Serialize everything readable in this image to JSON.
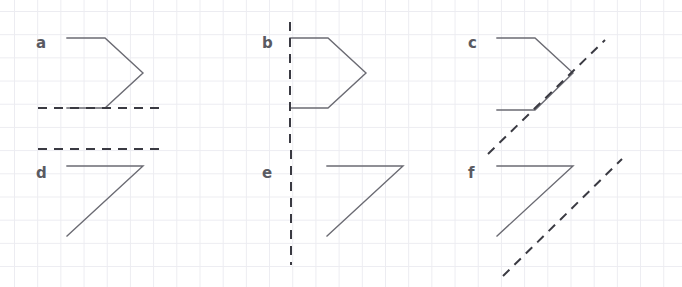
{
  "worksheet": {
    "title": "Reflections worksheet",
    "description": "Six lettered figures drawn on a light square grid, each paired with a dashed mirror line",
    "width": 682,
    "height": 287,
    "background_color": "#ffffff",
    "grid": {
      "visible": true,
      "color": "#ececf1",
      "spacing": 23.2,
      "offset_x": 14,
      "offset_y": 11
    },
    "style": {
      "shape_stroke_color": "#6b6b73",
      "shape_stroke_width": 1.4,
      "mirror_line_color": "#3a3a42",
      "mirror_line_width": 2,
      "mirror_dash_pattern": "9 7",
      "label_color": "#5a5a62",
      "label_font_size": 15
    },
    "items": [
      {
        "id": "a",
        "label": "a",
        "label_x": 36,
        "label_y": 36,
        "shape_type": "pentagon-arrow",
        "shape_points": "67,38 105,38 143,73 105,108 67,108",
        "mirror_orientation": "horizontal",
        "mirror_x1": 38,
        "mirror_y1": 108,
        "mirror_x2": 165,
        "mirror_y2": 108
      },
      {
        "id": "b",
        "label": "b",
        "label_x": 262,
        "label_y": 36,
        "shape_type": "pentagon-arrow",
        "shape_points": "290,38 328,38 366,73 328,108 290,108",
        "mirror_orientation": "vertical",
        "mirror_x1": 290,
        "mirror_y1": 22,
        "mirror_x2": 290,
        "mirror_y2": 148
      },
      {
        "id": "c",
        "label": "c",
        "label_x": 468,
        "label_y": 36,
        "shape_type": "pentagon-arrow",
        "shape_points": "497,38 535,38 573,73 535,110 497,110",
        "mirror_orientation": "diagonal",
        "mirror_x1": 488,
        "mirror_y1": 154,
        "mirror_x2": 605,
        "mirror_y2": 40
      },
      {
        "id": "d",
        "label": "d",
        "label_x": 36,
        "label_y": 166,
        "shape_type": "right-triangle",
        "shape_points": "67,166 143,166 67,236",
        "mirror_orientation": "horizontal",
        "mirror_x1": 38,
        "mirror_y1": 149,
        "mirror_x2": 165,
        "mirror_y2": 149
      },
      {
        "id": "e",
        "label": "e",
        "label_x": 262,
        "label_y": 166,
        "shape_type": "right-triangle",
        "shape_points": "327,166 403,166 327,236",
        "mirror_orientation": "vertical",
        "mirror_x1": 291,
        "mirror_y1": 150,
        "mirror_x2": 291,
        "mirror_y2": 265
      },
      {
        "id": "f",
        "label": "f",
        "label_x": 468,
        "label_y": 166,
        "shape_type": "right-triangle",
        "shape_points": "497,166 573,166 497,236",
        "mirror_orientation": "diagonal",
        "mirror_x1": 503,
        "mirror_y1": 276,
        "mirror_x2": 622,
        "mirror_y2": 159
      }
    ]
  }
}
